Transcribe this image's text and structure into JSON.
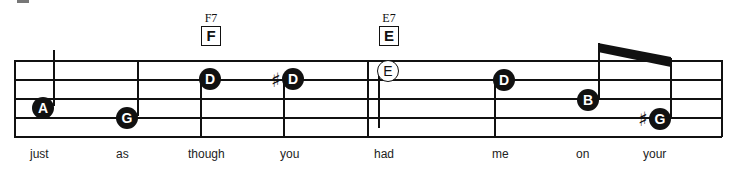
{
  "score": {
    "chords": [
      {
        "name": "F7",
        "box": "F"
      },
      {
        "name": "E7",
        "box": "E"
      }
    ],
    "notes": [
      {
        "letter": "A",
        "style": "filled",
        "accidental": ""
      },
      {
        "letter": "G",
        "style": "filled",
        "accidental": ""
      },
      {
        "letter": "D",
        "style": "filled",
        "accidental": ""
      },
      {
        "letter": "D",
        "style": "filled",
        "accidental": "♯"
      },
      {
        "letter": "E",
        "style": "open",
        "accidental": ""
      },
      {
        "letter": "D",
        "style": "filled",
        "accidental": ""
      },
      {
        "letter": "B",
        "style": "filled",
        "accidental": ""
      },
      {
        "letter": "G",
        "style": "filled",
        "accidental": "♯"
      }
    ],
    "lyrics": [
      "just",
      "as",
      "though",
      "you",
      "had",
      "me",
      "on",
      "your"
    ]
  },
  "colors": {
    "ink": "#111111",
    "background": "#ffffff"
  }
}
